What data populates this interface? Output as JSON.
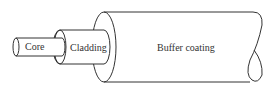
{
  "diagram": {
    "labels": {
      "core": "Core",
      "cladding": "Cladding",
      "buffer": "Buffer coating"
    },
    "colors": {
      "line": "#333333",
      "background": "#ffffff"
    }
  }
}
